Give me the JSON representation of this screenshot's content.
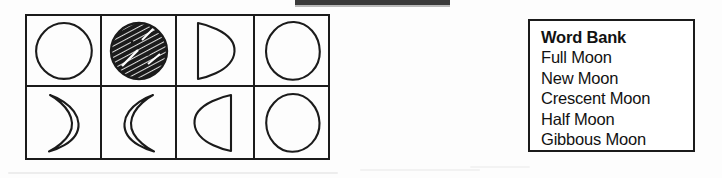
{
  "document": {
    "type": "worksheet",
    "subject": "Moon Phases",
    "background_color": "#ffffff",
    "ink_color": "#1b1b1b"
  },
  "top_bar": {
    "present": true,
    "color": "#3a3a3a"
  },
  "phase_grid": {
    "rows": 2,
    "columns": 4,
    "border_color": "#1b1b1b",
    "cells": [
      {
        "position": 1,
        "row": 1,
        "column": 1,
        "shape": "full-circle-outline",
        "answer_blank": true
      },
      {
        "position": 2,
        "row": 1,
        "column": 2,
        "shape": "hatched-filled-circle",
        "answer_blank": true
      },
      {
        "position": 3,
        "row": 1,
        "column": 3,
        "shape": "half-circle-right",
        "answer_blank": true
      },
      {
        "position": 4,
        "row": 1,
        "column": 4,
        "shape": "full-circle-outline",
        "answer_blank": true
      },
      {
        "position": 5,
        "row": 2,
        "column": 1,
        "shape": "crescent-right",
        "answer_blank": true
      },
      {
        "position": 6,
        "row": 2,
        "column": 2,
        "shape": "crescent-left",
        "answer_blank": true
      },
      {
        "position": 7,
        "row": 2,
        "column": 3,
        "shape": "half-circle-left",
        "answer_blank": true
      },
      {
        "position": 8,
        "row": 2,
        "column": 4,
        "shape": "full-circle-outline",
        "answer_blank": true
      }
    ]
  },
  "word_bank": {
    "title": "Word Bank",
    "items": [
      "Full Moon",
      "New Moon",
      "Crescent Moon",
      "Half Moon",
      "Gibbous Moon"
    ]
  }
}
